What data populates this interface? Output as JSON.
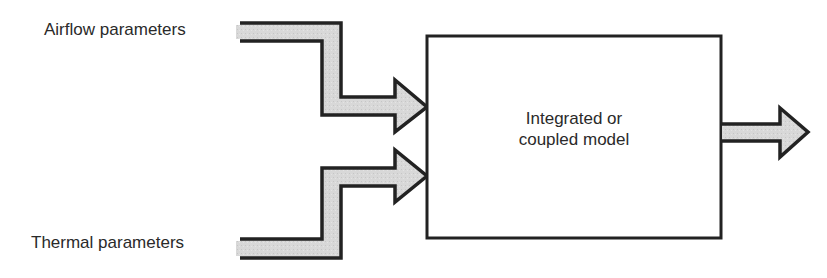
{
  "diagram": {
    "inputs": [
      {
        "label": "Airflow parameters"
      },
      {
        "label": "Thermal parameters"
      }
    ],
    "model": {
      "line1": "Integrated or",
      "line2": "coupled model"
    },
    "output": {
      "label": ""
    },
    "colors": {
      "arrow_fill": "#d6d6d6",
      "stroke": "#222222",
      "background": "#ffffff"
    }
  }
}
